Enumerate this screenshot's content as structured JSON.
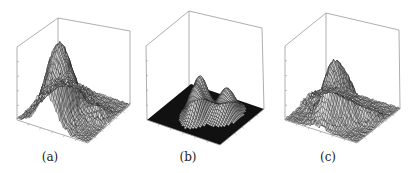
{
  "figure": {
    "panels": [
      {
        "id": "a",
        "caption": "(a)",
        "offset_x": 0,
        "caption_x": 50,
        "box": {
          "left_top": [
            17,
            47
          ],
          "back_top": [
            58,
            18
          ],
          "right_top": [
            130,
            31
          ],
          "left_bottom": [
            17,
            120
          ],
          "front_bottom": [
            88,
            143
          ],
          "right_bottom": [
            130,
            105
          ],
          "back_bottom": [
            58,
            92
          ]
        },
        "floor_dark": false,
        "peaks": [
          {
            "u": 0.42,
            "v": 0.28,
            "h": 100,
            "su": 0.13,
            "sv": 0.22
          },
          {
            "u": 0.8,
            "v": 0.55,
            "h": 14,
            "su": 0.1,
            "sv": 0.1
          },
          {
            "u": 0.2,
            "v": 0.7,
            "h": 10,
            "su": 0.18,
            "sv": 0.18
          }
        ],
        "noise": 6
      },
      {
        "id": "b",
        "caption": "(b)",
        "offset_x": 0,
        "caption_x": 188,
        "box": {
          "left_top": [
            146,
            46
          ],
          "back_top": [
            189,
            11
          ],
          "right_top": [
            262,
            28
          ],
          "left_bottom": [
            147,
            120
          ],
          "front_bottom": [
            220,
            145
          ],
          "right_bottom": [
            264,
            109
          ],
          "back_bottom": [
            189,
            86
          ]
        },
        "floor_dark": true,
        "peaks": [
          {
            "u": 0.48,
            "v": 0.4,
            "h": 55,
            "su": 0.07,
            "sv": 0.14
          },
          {
            "u": 0.72,
            "v": 0.6,
            "h": 38,
            "su": 0.08,
            "sv": 0.14
          },
          {
            "u": 0.35,
            "v": 0.5,
            "h": 25,
            "su": 0.05,
            "sv": 0.12
          }
        ],
        "noise": 0
      },
      {
        "id": "c",
        "caption": "(c)",
        "offset_x": 0,
        "caption_x": 328,
        "box": {
          "left_top": [
            285,
            46
          ],
          "back_top": [
            326,
            13
          ],
          "right_top": [
            399,
            30
          ],
          "left_bottom": [
            285,
            120
          ],
          "front_bottom": [
            357,
            143
          ],
          "right_bottom": [
            400,
            109
          ],
          "back_bottom": [
            326,
            88
          ]
        },
        "floor_dark": false,
        "peaks": [
          {
            "u": 0.45,
            "v": 0.33,
            "h": 62,
            "su": 0.1,
            "sv": 0.14
          },
          {
            "u": 0.6,
            "v": 0.45,
            "h": 40,
            "su": 0.1,
            "sv": 0.12
          },
          {
            "u": 0.82,
            "v": 0.58,
            "h": 20,
            "su": 0.07,
            "sv": 0.08
          },
          {
            "u": 0.25,
            "v": 0.55,
            "h": 18,
            "su": 0.15,
            "sv": 0.15
          }
        ],
        "noise": 6
      }
    ]
  }
}
